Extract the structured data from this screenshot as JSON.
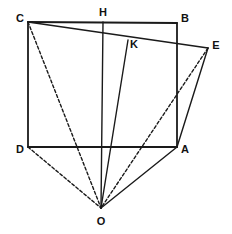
{
  "figure": {
    "canvas": {
      "width": 232,
      "height": 234
    },
    "style": {
      "background": "#ffffff",
      "stroke_color": "#1a1a1a",
      "label_color": "#111111",
      "solid_width": 1.4,
      "heavy_width": 1.8,
      "dash_pattern": "3,2.2"
    },
    "points": [
      {
        "id": "C",
        "label": "C",
        "x": 28,
        "y": 22,
        "label_x": 20,
        "label_y": 19
      },
      {
        "id": "H",
        "label": "H",
        "x": 103,
        "y": 22,
        "label_x": 103,
        "label_y": 13
      },
      {
        "id": "B",
        "label": "B",
        "x": 177,
        "y": 23,
        "label_x": 185,
        "label_y": 19
      },
      {
        "id": "E",
        "label": "E",
        "x": 208,
        "y": 48,
        "label_x": 216,
        "label_y": 46
      },
      {
        "id": "K",
        "label": "K",
        "x": 128,
        "y": 40,
        "label_x": 134,
        "label_y": 45
      },
      {
        "id": "D",
        "label": "D",
        "x": 28,
        "y": 147,
        "label_x": 20,
        "label_y": 150
      },
      {
        "id": "A",
        "label": "A",
        "x": 177,
        "y": 147,
        "label_x": 185,
        "label_y": 150
      },
      {
        "id": "O",
        "label": "O",
        "x": 101,
        "y": 208,
        "label_x": 101,
        "label_y": 222
      }
    ],
    "segments": [
      {
        "id": "seg-C-B",
        "from": "C",
        "to": "B",
        "style": "solid",
        "weight": "heavy",
        "name": "rectangle-top-edge"
      },
      {
        "id": "seg-B-A",
        "from": "B",
        "to": "A",
        "style": "solid",
        "weight": "heavy",
        "name": "rectangle-right-edge"
      },
      {
        "id": "seg-A-D",
        "from": "A",
        "to": "D",
        "style": "solid",
        "weight": "heavy",
        "name": "rectangle-bottom-edge"
      },
      {
        "id": "seg-D-C",
        "from": "D",
        "to": "C",
        "style": "solid",
        "weight": "heavy",
        "name": "rectangle-left-edge"
      },
      {
        "id": "seg-C-E",
        "from": "C",
        "to": "E",
        "style": "solid",
        "weight": "normal",
        "name": "tilted-top-edge"
      },
      {
        "id": "seg-E-A",
        "from": "E",
        "to": "A",
        "style": "solid",
        "weight": "normal",
        "name": "tilted-right-edge"
      },
      {
        "id": "seg-H-O",
        "from": "H",
        "to": "O",
        "style": "solid",
        "weight": "normal",
        "name": "vertical-axis"
      },
      {
        "id": "seg-K-O",
        "from": "K",
        "to": "O",
        "style": "solid",
        "weight": "normal",
        "name": "ray-through-K"
      },
      {
        "id": "seg-A-O",
        "from": "A",
        "to": "O",
        "style": "solid",
        "weight": "normal",
        "name": "ray-to-A"
      },
      {
        "id": "seg-C-O",
        "from": "C",
        "to": "O",
        "style": "dashed",
        "weight": "normal",
        "name": "ray-to-C"
      },
      {
        "id": "seg-D-O",
        "from": "D",
        "to": "O",
        "style": "dashed",
        "weight": "normal",
        "name": "ray-to-D"
      },
      {
        "id": "seg-E-O",
        "from": "E",
        "to": "O",
        "style": "dashed",
        "weight": "normal",
        "name": "ray-to-E"
      }
    ]
  }
}
